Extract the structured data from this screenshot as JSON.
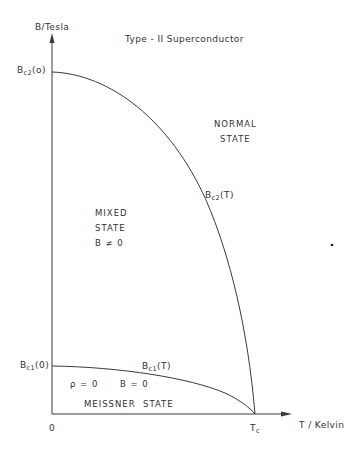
{
  "title": "Type - II Superconductor",
  "axes": {
    "y_label": "B/Tesla",
    "x_label": "T / Kelvin",
    "origin_label": "0",
    "tc_label": {
      "main": "T",
      "sub": "c"
    }
  },
  "y_ticks": {
    "bc2_zero": {
      "main": "B",
      "sub": "c2",
      "suffix": "(o)"
    },
    "bc1_zero": {
      "main": "B",
      "sub": "c1",
      "suffix": "(0)"
    }
  },
  "curves": {
    "bc2": {
      "main": "B",
      "sub": "c2",
      "suffix": "(T)"
    },
    "bc1": {
      "main": "B",
      "sub": "c1",
      "suffix": "(T)"
    }
  },
  "regions": {
    "normal": {
      "line1": "NORMAL",
      "line2": "STATE"
    },
    "mixed": {
      "line1": "MIXED",
      "line2": "STATE",
      "line3": "B ≠ 0"
    },
    "meissner": {
      "rho": "ρ = 0",
      "b": "B = 0",
      "name": "MEISSNER  STATE"
    }
  },
  "colors": {
    "line": "#3a3a3a",
    "text": "#333333",
    "background": "#ffffff"
  }
}
